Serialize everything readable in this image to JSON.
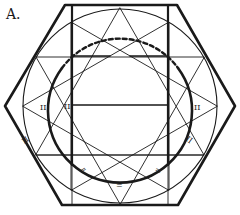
{
  "figure": {
    "label": "A.",
    "stroke_color": "#1a1a1a",
    "background": "#ffffff",
    "marks": [
      "II",
      "II",
      "II",
      "II",
      "=",
      "=",
      "=",
      "II"
    ]
  }
}
